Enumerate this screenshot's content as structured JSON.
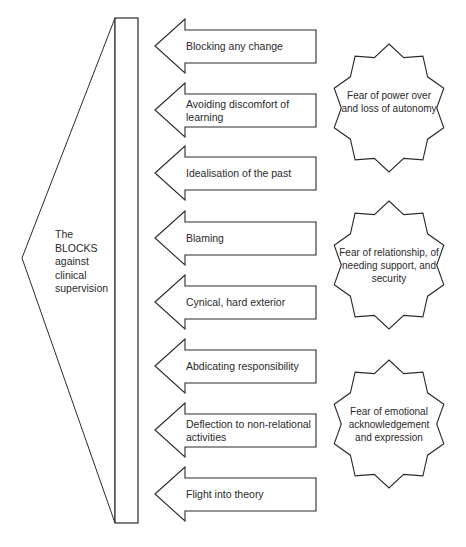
{
  "diagram": {
    "center_label": [
      "The",
      "BLOCKS",
      "against",
      "clinical",
      "supervision"
    ],
    "blocks": [
      {
        "label": "Blocking any change",
        "y": 46
      },
      {
        "label": "Avoiding discomfort of learning",
        "y": 110
      },
      {
        "label": "Idealisation of the past",
        "y": 173
      },
      {
        "label": "Blaming",
        "y": 238
      },
      {
        "label": "Cynical, hard exterior",
        "y": 302
      },
      {
        "label": "Abdicating responsibility",
        "y": 366
      },
      {
        "label": "Deflection to non-relational activities",
        "y": 430
      },
      {
        "label": "Flight into theory",
        "y": 494
      }
    ],
    "fears": [
      {
        "label": "Fear of power over and loss of autonomy",
        "cx": 389,
        "cy": 108
      },
      {
        "label": "Fear of relationship, of needing support, and security",
        "cx": 389,
        "cy": 265
      },
      {
        "label": "Fear of emotional acknowledgement and expression",
        "cx": 389,
        "cy": 424
      }
    ],
    "colors": {
      "stroke": "#2a2a2a",
      "fill": "#ffffff"
    }
  }
}
